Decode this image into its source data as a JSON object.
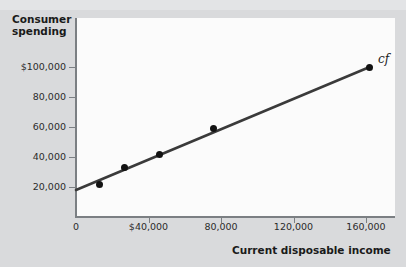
{
  "chart_data": {
    "type": "scatter",
    "title": "",
    "xlabel": "Current disposable income",
    "ylabel": "Consumer spending",
    "xlim": [
      0,
      180000
    ],
    "ylim": [
      0,
      112000
    ],
    "grid": false,
    "legend_position": "none",
    "x_ticks": [
      {
        "value": 0,
        "label": "0"
      },
      {
        "value": 40000,
        "label": "$40,000"
      },
      {
        "value": 80000,
        "label": "80,000"
      },
      {
        "value": 120000,
        "label": "120,000"
      },
      {
        "value": 160000,
        "label": "160,000"
      }
    ],
    "y_ticks": [
      {
        "value": 20000,
        "label": "20,000"
      },
      {
        "value": 40000,
        "label": "40,000"
      },
      {
        "value": 60000,
        "label": "60,000"
      },
      {
        "value": 80000,
        "label": "80,000"
      },
      {
        "value": 100000,
        "label": "$100,000"
      }
    ],
    "points": [
      {
        "x": 13000,
        "y": 22000
      },
      {
        "x": 27000,
        "y": 33000
      },
      {
        "x": 46000,
        "y": 42000
      },
      {
        "x": 76000,
        "y": 59000
      },
      {
        "x": 162000,
        "y": 100000
      }
    ],
    "series": [
      {
        "name": "cf",
        "type": "line",
        "annotation": "cf",
        "intercept": 18000,
        "endpoint": {
          "x": 162000,
          "y": 100000
        },
        "start": {
          "x": 0,
          "y": 18000
        }
      }
    ],
    "annotations": [
      {
        "text": "cf",
        "x": 168000,
        "y": 104000,
        "style": "italic-serif"
      }
    ],
    "colors": {
      "line": "#3a3a3a",
      "point": "#121212",
      "axis": "#7b7f83",
      "plot_background": "#fbfbfb",
      "figure_background": "#d9dadc",
      "text": "#1a1a1a"
    }
  }
}
